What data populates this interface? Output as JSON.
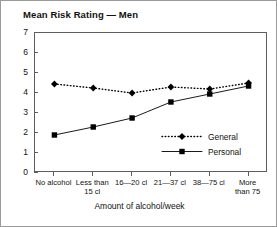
{
  "chart_data": {
    "type": "line",
    "title": "Mean Risk Rating — Men",
    "xlabel": "Amount of alcohol/week",
    "ylabel": "",
    "ylim": [
      0,
      7
    ],
    "yticks": [
      0,
      1,
      2,
      3,
      4,
      5,
      6,
      7
    ],
    "grid": false,
    "legend_position": "inside-right",
    "categories": [
      "No alcohol",
      "Less than 15 cl",
      "16—20 cl",
      "21—37 cl",
      "38—75 cl",
      "More than 75"
    ],
    "category_lines": [
      [
        "No alcohol"
      ],
      [
        "Less than",
        "15 cl"
      ],
      [
        "16—20 cl"
      ],
      [
        "21—37 cl"
      ],
      [
        "38—75 cl"
      ],
      [
        "More",
        "than 75"
      ]
    ],
    "series": [
      {
        "name": "General",
        "marker": "diamond",
        "line": "dotted",
        "color": "#000000",
        "values": [
          4.45,
          4.25,
          4.0,
          4.3,
          4.2,
          4.5
        ]
      },
      {
        "name": "Personal",
        "marker": "square",
        "line": "solid",
        "color": "#000000",
        "values": [
          1.9,
          2.3,
          2.75,
          3.55,
          3.95,
          4.35
        ]
      }
    ]
  },
  "legend": {
    "items": [
      {
        "label": "General"
      },
      {
        "label": "Personal"
      }
    ]
  },
  "axis": {
    "y_tick_labels": [
      "7",
      "6",
      "5",
      "4",
      "3",
      "2",
      "1",
      "0"
    ]
  }
}
